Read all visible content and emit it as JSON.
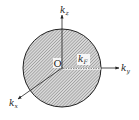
{
  "diagram": {
    "labels": {
      "kz": {
        "base": "k",
        "sub": "z"
      },
      "ky": {
        "base": "k",
        "sub": "y"
      },
      "kx": {
        "base": "k",
        "sub": "x"
      },
      "kF": {
        "base": "k",
        "sub": "F"
      },
      "origin": "O"
    },
    "sphere": {
      "cx": 62,
      "cy": 68,
      "r": 39,
      "fill": "hatched",
      "stroke": "#222222"
    },
    "colors": {
      "line": "#222222",
      "hatch": "#888888",
      "background": "#ffffff"
    }
  }
}
